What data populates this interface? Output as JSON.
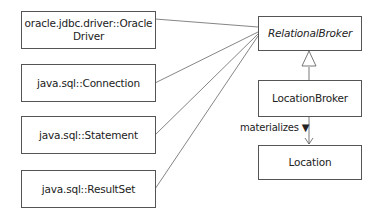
{
  "diagram": {
    "type": "UML class diagram",
    "left_classes": [
      {
        "name": "oracle.jdbc.driver::Oracle Driver",
        "line1": "oracle.jdbc.driver::Oracle",
        "line2": "Driver"
      },
      {
        "name": "java.sql::Connection"
      },
      {
        "name": "java.sql::Statement"
      },
      {
        "name": "java.sql::ResultSet"
      }
    ],
    "abstract_class": {
      "name": "RelationalBroker",
      "style": "italic"
    },
    "subclass": {
      "name": "LocationBroker"
    },
    "target_class": {
      "name": "Location"
    },
    "associations": {
      "materializes_label": "materializes ▼"
    },
    "relationships": [
      {
        "from": "oracle.jdbc.driver::Oracle Driver",
        "to": "RelationalBroker",
        "type": "association"
      },
      {
        "from": "java.sql::Connection",
        "to": "RelationalBroker",
        "type": "association"
      },
      {
        "from": "java.sql::Statement",
        "to": "RelationalBroker",
        "type": "association"
      },
      {
        "from": "java.sql::ResultSet",
        "to": "RelationalBroker",
        "type": "association"
      },
      {
        "from": "LocationBroker",
        "to": "RelationalBroker",
        "type": "generalization"
      },
      {
        "from": "LocationBroker",
        "to": "Location",
        "type": "directed-association",
        "label": "materializes"
      }
    ]
  }
}
